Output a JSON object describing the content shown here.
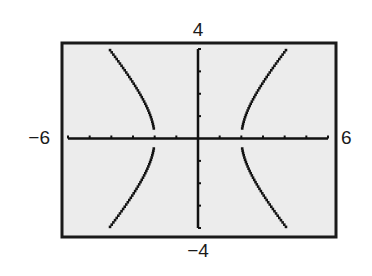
{
  "chart_data": {
    "type": "line",
    "title": "",
    "equation": "x^2/4 - y^2/5 = 1",
    "xlabel": "",
    "ylabel": "",
    "xlim": [
      -6,
      6
    ],
    "ylim": [
      -4,
      4
    ],
    "xscale": 1,
    "yscale": 1,
    "grid": false,
    "window_labels": {
      "xmin": "−6",
      "xmax": "6",
      "ymin": "−4",
      "ymax": "4"
    },
    "series": [
      {
        "name": "right branch",
        "points": [
          [
            2.0,
            0.0
          ],
          [
            2.2,
            1.02
          ],
          [
            2.5,
            1.68
          ],
          [
            2.8,
            2.19
          ],
          [
            3.1,
            2.65
          ],
          [
            3.4,
            3.07
          ],
          [
            3.7,
            3.48
          ],
          [
            4.0,
            3.87
          ],
          [
            4.1,
            4.0
          ]
        ]
      },
      {
        "name": "left branch",
        "points": [
          [
            -2.0,
            0.0
          ],
          [
            -2.2,
            1.02
          ],
          [
            -2.5,
            1.68
          ],
          [
            -2.8,
            2.19
          ],
          [
            -3.1,
            2.65
          ],
          [
            -3.4,
            3.07
          ],
          [
            -3.7,
            3.48
          ],
          [
            -4.0,
            3.87
          ],
          [
            -4.1,
            4.0
          ]
        ]
      }
    ],
    "vertices": [
      [
        -2,
        0
      ],
      [
        2,
        0
      ]
    ],
    "colors": {
      "window_background": "#ececec",
      "frame": "#1a1a1a",
      "axes": "#111111",
      "curve": "#111111"
    }
  }
}
